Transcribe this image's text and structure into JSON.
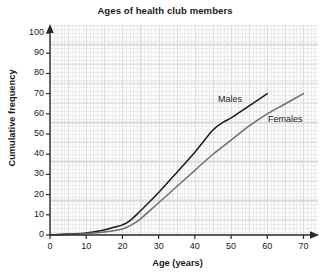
{
  "chart_data": {
    "type": "line",
    "title": "Ages of health club members",
    "xlabel": "Age (years)",
    "ylabel": "Cumulative frequency",
    "xlim": [
      0,
      74
    ],
    "ylim": [
      0,
      104
    ],
    "xticks": [
      "0",
      "10",
      "20",
      "30",
      "40",
      "50",
      "60",
      "70"
    ],
    "xtick_values": [
      0,
      10,
      20,
      30,
      40,
      50,
      60,
      70
    ],
    "yticks": [
      "0",
      "10",
      "20",
      "30",
      "40",
      "50",
      "60",
      "70",
      "80",
      "90",
      "100"
    ],
    "ytick_values": [
      0,
      10,
      20,
      30,
      40,
      50,
      60,
      70,
      80,
      90,
      100
    ],
    "grid": true,
    "legend_position": "inline-annotations",
    "series": [
      {
        "name": "Males",
        "color": "#1a1a1a",
        "x": [
          0,
          5,
          10,
          15,
          18,
          20,
          22,
          25,
          30,
          35,
          40,
          45,
          48,
          50,
          55,
          60
        ],
        "values": [
          0,
          0.5,
          1,
          2.5,
          4,
          5,
          7,
          12,
          21,
          31,
          41,
          52,
          56,
          58,
          64,
          70
        ]
      },
      {
        "name": "Females",
        "color": "#6e6e6e",
        "x": [
          0,
          5,
          10,
          15,
          18,
          20,
          22,
          25,
          30,
          35,
          40,
          45,
          50,
          55,
          60,
          65,
          70
        ],
        "values": [
          0,
          0.3,
          0.7,
          1.5,
          2.2,
          3,
          4.5,
          8,
          16,
          24,
          32,
          40,
          47,
          54,
          60,
          65,
          70
        ]
      }
    ],
    "annotations": [
      {
        "text": "Males",
        "x": 46,
        "y": 75
      },
      {
        "text": "Females",
        "x": 60,
        "y": 64
      }
    ]
  }
}
